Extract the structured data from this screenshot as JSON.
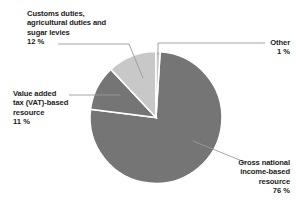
{
  "chart_data": {
    "type": "pie",
    "title": "",
    "subtitle": "",
    "xlabel": "",
    "ylabel": "",
    "legend_position": "none",
    "grid": false,
    "units": "%",
    "categories": [
      "Gross national income-based resource",
      "Customs duties, agricultural duties and sugar levies",
      "Value added tax (VAT)-based resource",
      "Other"
    ],
    "values": [
      76,
      12,
      11,
      1
    ],
    "colors": [
      "#757575",
      "#c8c8c8",
      "#757575",
      "#c8c8c8"
    ],
    "slices": [
      {
        "name": "Gross national income-based resource",
        "value": 76,
        "value_label": "76 %",
        "color": "#757575"
      },
      {
        "name": "Customs duties, agricultural duties and sugar levies",
        "value": 12,
        "value_label": "12 %",
        "color": "#c8c8c8"
      },
      {
        "name": "Value added tax (VAT)-based resource",
        "value": 11,
        "value_label": "11 %",
        "color": "#757575"
      },
      {
        "name": "Other",
        "value": 1,
        "value_label": "1 %",
        "color": "#c8c8c8"
      }
    ]
  },
  "labels": {
    "customs": {
      "line1": "Customs duties,",
      "line2": "agricultural duties and",
      "line3": "sugar levies",
      "value": "12 %"
    },
    "vat": {
      "line1": "Value added",
      "line2": "tax (VAT)-based",
      "line3": "resource",
      "value": "11 %"
    },
    "other": {
      "line1": "Other",
      "value": "1 %"
    },
    "gni": {
      "line1": "Gross national",
      "line2": "income-based",
      "line3": "resource",
      "value": "76 %"
    }
  },
  "style": {
    "background": "#ffffff",
    "text_color": "#1c1c1c",
    "leader_line_color": "#9a9a9a",
    "slice_border": "#ffffff"
  }
}
